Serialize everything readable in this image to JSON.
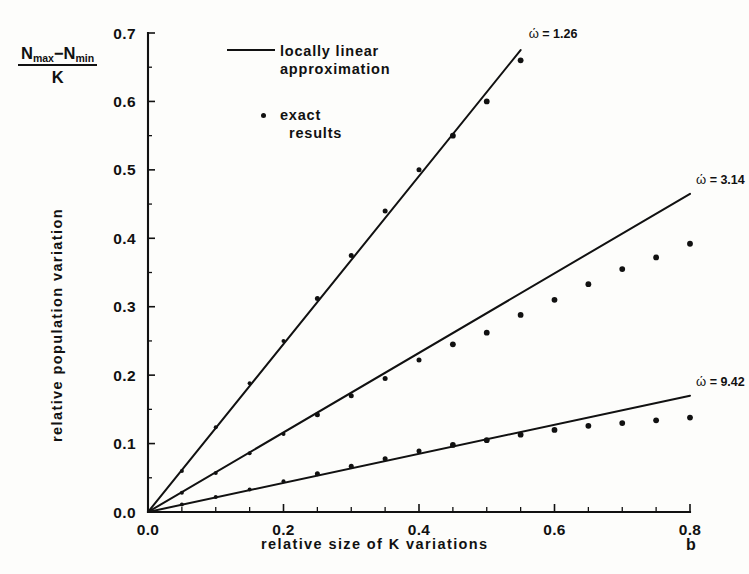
{
  "figure": {
    "y_axis_formula": {
      "numerator_a": "N",
      "numerator_a_sub": "max",
      "minus": "−",
      "numerator_b": "N",
      "numerator_b_sub": "min",
      "denominator": "K"
    },
    "x_axis_title": "relative size of K variations",
    "y_axis_title": "relative population variation",
    "x_variable_symbol": "b"
  },
  "legend": {
    "entries": [
      {
        "key": "line",
        "line1": "locally  linear",
        "line2": "approximation"
      },
      {
        "key": "dot",
        "line1": "exact",
        "line2": "results"
      }
    ]
  },
  "chart_data": {
    "type": "line",
    "title": "",
    "xlabel": "relative size of K variations",
    "ylabel": "relative population variation",
    "xlim": [
      0.0,
      0.8
    ],
    "ylim": [
      0.0,
      0.7
    ],
    "xticks": [
      "0.0",
      "0.2",
      "0.4",
      "0.6",
      "0.8"
    ],
    "xtick_values": [
      0.0,
      0.2,
      0.4,
      0.6,
      0.8
    ],
    "xminor_step": 0.05,
    "yticks": [
      "0.0",
      "0.1",
      "0.2",
      "0.3",
      "0.4",
      "0.5",
      "0.6",
      "0.7"
    ],
    "ytick_values": [
      0.0,
      0.1,
      0.2,
      0.3,
      0.4,
      0.5,
      0.6,
      0.7
    ],
    "grid": false,
    "legend_position": "upper-left-inside",
    "series": [
      {
        "name": "ω' = 1.26",
        "label_text": "ώ = 1.26",
        "omega_symbol": "ώ",
        "omega_value": "1.26",
        "kind": "locally linear approximation",
        "line": {
          "x": [
            0.0,
            0.55
          ],
          "y": [
            0.0,
            0.675
          ],
          "slope": 1.227
        },
        "points_label": "exact results",
        "x": [
          0.05,
          0.1,
          0.15,
          0.2,
          0.25,
          0.3,
          0.35,
          0.4,
          0.45,
          0.5,
          0.55
        ],
        "y": [
          0.06,
          0.124,
          0.188,
          0.25,
          0.312,
          0.375,
          0.44,
          0.5,
          0.55,
          0.6,
          0.66
        ]
      },
      {
        "name": "ω' = 3.14",
        "label_text": "ώ = 3.14",
        "omega_symbol": "ώ",
        "omega_value": "3.14",
        "kind": "locally linear approximation",
        "line": {
          "x": [
            0.0,
            0.8
          ],
          "y": [
            0.0,
            0.465
          ],
          "slope": 0.581
        },
        "points_label": "exact results",
        "x": [
          0.05,
          0.1,
          0.15,
          0.2,
          0.25,
          0.3,
          0.35,
          0.4,
          0.45,
          0.5,
          0.55,
          0.6,
          0.65,
          0.7,
          0.75,
          0.8
        ],
        "y": [
          0.028,
          0.057,
          0.086,
          0.114,
          0.142,
          0.17,
          0.195,
          0.222,
          0.245,
          0.262,
          0.288,
          0.31,
          0.333,
          0.355,
          0.372,
          0.392
        ]
      },
      {
        "name": "ω' = 9.42",
        "label_text": "ώ = 9.42",
        "omega_symbol": "ώ",
        "omega_value": "9.42",
        "kind": "locally linear approximation",
        "line": {
          "x": [
            0.0,
            0.8
          ],
          "y": [
            0.0,
            0.17
          ],
          "slope": 0.2125
        },
        "points_label": "exact results",
        "x": [
          0.05,
          0.1,
          0.15,
          0.2,
          0.25,
          0.3,
          0.35,
          0.4,
          0.45,
          0.5,
          0.55,
          0.6,
          0.65,
          0.7,
          0.75,
          0.8
        ],
        "y": [
          0.011,
          0.022,
          0.033,
          0.045,
          0.056,
          0.067,
          0.078,
          0.089,
          0.098,
          0.105,
          0.113,
          0.12,
          0.126,
          0.13,
          0.134,
          0.138
        ]
      }
    ]
  }
}
